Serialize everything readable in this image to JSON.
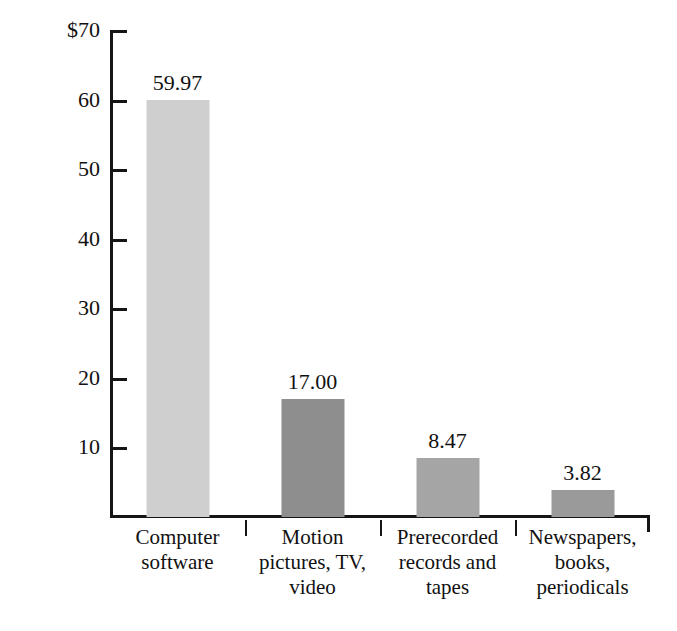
{
  "chart_data": {
    "type": "bar",
    "title": "",
    "xlabel": "",
    "ylabel": "Export sales in 2002 ($billion)",
    "ylim": [
      0,
      70
    ],
    "ytick_labels": [
      "$70",
      "60",
      "50",
      "40",
      "30",
      "20",
      "10"
    ],
    "ytick_values": [
      70,
      60,
      50,
      40,
      30,
      20,
      10
    ],
    "grid": false,
    "legend": "none",
    "categories": [
      "Computer software",
      "Motion pictures, TV, video",
      "Prerecorded records and tapes",
      "Newspapers, books, periodicals"
    ],
    "category_lines": [
      [
        "Computer",
        "software"
      ],
      [
        "Motion",
        "pictures, TV,",
        "video"
      ],
      [
        "Prerecorded",
        "records and",
        "tapes"
      ],
      [
        "Newspapers,",
        "books,",
        "periodicals"
      ]
    ],
    "values": [
      59.97,
      17.0,
      8.47,
      3.82
    ],
    "value_labels": [
      "59.97",
      "17.00",
      "8.47",
      "3.82"
    ],
    "bar_colors": [
      "#cfcfcf",
      "#8e8e8e",
      "#a5a5a5",
      "#9a9a9a"
    ],
    "axis_color": "#151515"
  }
}
